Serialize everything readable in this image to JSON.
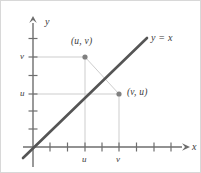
{
  "figure": {
    "kind": "coordinate-plane-diagram",
    "background_color": "#ffffff",
    "border_color": "#d8d8d8"
  },
  "axes": {
    "x_axis_name": "x",
    "y_axis_name": "y",
    "axis_color": "#6e6e6e",
    "origin_px": {
      "x": 32,
      "y": 146
    },
    "x_tick_spacing_px": 17,
    "y_tick_spacing_px": 17,
    "x_tick_count": 9,
    "y_tick_count": 7,
    "x_axis_end_px": 186,
    "y_axis_top_px": 18
  },
  "ticks": {
    "x_labels": [
      {
        "text": "u",
        "x_px": 84
      },
      {
        "text": "v",
        "x_px": 118
      }
    ],
    "y_labels": [
      {
        "text": "v",
        "y_px": 56
      },
      {
        "text": "u",
        "y_px": 93
      }
    ]
  },
  "line": {
    "label": "y = x",
    "color": "#555555",
    "width_px": 2.6,
    "start_px": {
      "x": 22,
      "y": 157
    },
    "end_px": {
      "x": 146,
      "y": 37
    },
    "label_px": {
      "x": 149,
      "y": 35
    }
  },
  "points": [
    {
      "label": "(u, v)",
      "px": {
        "x": 84,
        "y": 56
      },
      "label_px": {
        "x": 70,
        "y": 38
      },
      "color": "#808080"
    },
    {
      "label": "(v, u)",
      "px": {
        "x": 118,
        "y": 93
      },
      "label_px": {
        "x": 126,
        "y": 88
      },
      "color": "#808080"
    }
  ],
  "guides": {
    "color": "#cdcdcd",
    "connector_color": "#cdcdcd",
    "segments": [
      {
        "name": "v-horizontal-guide",
        "x1": 32,
        "y1": 56,
        "x2": 84,
        "y2": 56
      },
      {
        "name": "u-horizontal-guide",
        "x1": 32,
        "y1": 93,
        "x2": 118,
        "y2": 93
      },
      {
        "name": "u-vertical-guide",
        "x1": 84,
        "y1": 56,
        "x2": 84,
        "y2": 146
      },
      {
        "name": "v-vertical-guide",
        "x1": 118,
        "y1": 93,
        "x2": 118,
        "y2": 146
      },
      {
        "name": "reflection-connector",
        "x1": 84,
        "y1": 56,
        "x2": 118,
        "y2": 93
      }
    ]
  }
}
